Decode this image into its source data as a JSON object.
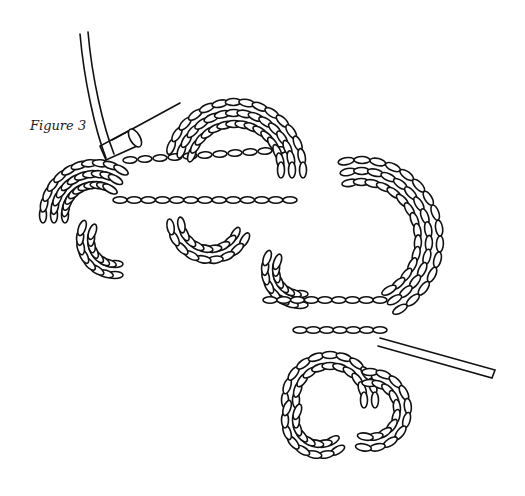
{
  "figure": {
    "caption": "Figure 3",
    "colors": {
      "ink": "#111111",
      "background": "#ffffff"
    }
  }
}
